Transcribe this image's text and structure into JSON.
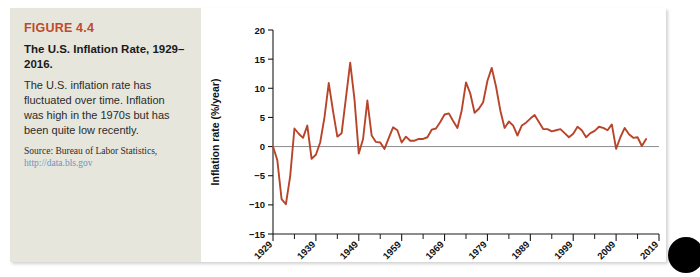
{
  "figure": {
    "number": "FIGURE 4.4",
    "title": "The U.S. Inflation Rate, 1929–2016.",
    "body": "The U.S. inflation rate has fluctuated over time. Inflation was high in the 1970s but has been quite low recently.",
    "source_label": "Source: Bureau of Labor Statistics,",
    "source_url": "http://data.bls.gov",
    "accent_color": "#c0492b",
    "panel_color": "#e6e6dd",
    "line_color": "#b8442a"
  },
  "chart_data": {
    "type": "line",
    "title": "",
    "xlabel": "Year",
    "ylabel": "Inflation rate (%/year)",
    "xlim": [
      1929,
      2019
    ],
    "ylim": [
      -15,
      20
    ],
    "ytick_labels": [
      "20",
      "15",
      "10",
      "5",
      "0",
      "−5",
      "−10",
      "−15"
    ],
    "yticks": [
      20,
      15,
      10,
      5,
      0,
      -5,
      -10,
      -15
    ],
    "xtick_labels": [
      "1929",
      "1939",
      "1949",
      "1959",
      "1969",
      "1979",
      "1989",
      "1999",
      "2009",
      "2019"
    ],
    "xticks": [
      1929,
      1939,
      1949,
      1959,
      1969,
      1979,
      1989,
      1999,
      2009,
      2019
    ],
    "xminor_step": 5,
    "grid": false,
    "legend": "none",
    "zero_line": true,
    "series": [
      {
        "name": "U.S. inflation rate",
        "color": "#b8442a",
        "x": [
          1929,
          1930,
          1931,
          1932,
          1933,
          1934,
          1935,
          1936,
          1937,
          1938,
          1939,
          1940,
          1941,
          1942,
          1943,
          1944,
          1945,
          1946,
          1947,
          1948,
          1949,
          1950,
          1951,
          1952,
          1953,
          1954,
          1955,
          1956,
          1957,
          1958,
          1959,
          1960,
          1961,
          1962,
          1963,
          1964,
          1965,
          1966,
          1967,
          1968,
          1969,
          1970,
          1971,
          1972,
          1973,
          1974,
          1975,
          1976,
          1977,
          1978,
          1979,
          1980,
          1981,
          1982,
          1983,
          1984,
          1985,
          1986,
          1987,
          1988,
          1989,
          1990,
          1991,
          1992,
          1993,
          1994,
          1995,
          1996,
          1997,
          1998,
          1999,
          2000,
          2001,
          2002,
          2003,
          2004,
          2005,
          2006,
          2007,
          2008,
          2009,
          2010,
          2011,
          2012,
          2013,
          2014,
          2015,
          2016
        ],
        "values": [
          0.0,
          -2.3,
          -9.0,
          -9.9,
          -5.1,
          3.1,
          2.2,
          1.5,
          3.6,
          -2.1,
          -1.4,
          0.7,
          5.0,
          10.9,
          6.1,
          1.7,
          2.3,
          8.3,
          14.4,
          8.1,
          -1.2,
          1.3,
          7.9,
          1.9,
          0.8,
          0.7,
          -0.4,
          1.5,
          3.3,
          2.8,
          0.7,
          1.7,
          1.0,
          1.0,
          1.3,
          1.3,
          1.6,
          2.9,
          3.1,
          4.2,
          5.5,
          5.7,
          4.4,
          3.2,
          6.2,
          11.0,
          9.1,
          5.8,
          6.5,
          7.6,
          11.3,
          13.5,
          10.3,
          6.2,
          3.2,
          4.3,
          3.6,
          1.9,
          3.6,
          4.1,
          4.8,
          5.4,
          4.2,
          3.0,
          3.0,
          2.6,
          2.8,
          3.0,
          2.3,
          1.6,
          2.2,
          3.4,
          2.8,
          1.6,
          2.3,
          2.7,
          3.4,
          3.2,
          2.8,
          3.8,
          -0.4,
          1.6,
          3.2,
          2.1,
          1.5,
          1.6,
          0.1,
          1.3
        ]
      }
    ]
  }
}
